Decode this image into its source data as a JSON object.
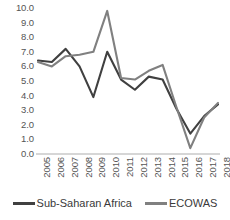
{
  "chart_data": {
    "type": "line",
    "title": "",
    "xlabel": "",
    "ylabel": "",
    "categories": [
      "2005",
      "2006",
      "2007",
      "2008",
      "2009",
      "2010",
      "2011",
      "2012",
      "2013",
      "2014",
      "2015",
      "2016",
      "2017",
      "2018"
    ],
    "x_tick_labels": [
      "2005",
      "2006",
      "2007",
      "2008",
      "2009",
      "2010",
      "2011",
      "2012",
      "2013",
      "2014",
      "2015",
      "2016",
      "2017",
      "2018"
    ],
    "y_tick_labels": [
      "10.0",
      "9.0",
      "8.0",
      "7.0",
      "6.0",
      "5.0",
      "4.0",
      "3.0",
      "2.0",
      "1.0",
      "0.0"
    ],
    "y_tick_values": [
      10.0,
      9.0,
      8.0,
      7.0,
      6.0,
      5.0,
      4.0,
      3.0,
      2.0,
      1.0,
      0.0
    ],
    "ylim": [
      0.0,
      10.0
    ],
    "grid": false,
    "legend_position": "bottom",
    "series": [
      {
        "name": "Sub-Saharan Africa",
        "color": "#404040",
        "values": [
          6.4,
          6.3,
          7.2,
          6.0,
          3.9,
          7.0,
          5.1,
          4.4,
          5.3,
          5.1,
          3.1,
          1.4,
          2.6,
          3.4
        ]
      },
      {
        "name": "ECOWAS",
        "color": "#808080",
        "values": [
          6.3,
          6.0,
          6.7,
          6.8,
          7.0,
          9.8,
          5.2,
          5.1,
          5.7,
          6.1,
          3.2,
          0.4,
          2.5,
          3.5
        ]
      }
    ]
  },
  "legend": {
    "items": [
      {
        "label": "Sub-Saharan Africa",
        "color": "#404040"
      },
      {
        "label": "ECOWAS",
        "color": "#808080"
      }
    ]
  },
  "colors": {
    "series_sub_saharan_africa": "#404040",
    "series_ecowas": "#808080",
    "axis_line": "#d6d6d6",
    "tick_text": "#555555",
    "background": "#ffffff"
  }
}
